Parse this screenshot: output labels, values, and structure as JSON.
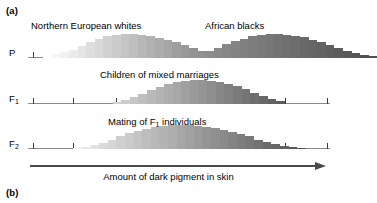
{
  "figure": {
    "panel_a_label": "(a)",
    "panel_b_label": "(b)",
    "axis_caption": "Amount of dark pigment in skin",
    "arrow_icon": "right-arrow-icon"
  },
  "rows": [
    {
      "id": "P",
      "gen_label": "P",
      "gen_label_sub": ""
    },
    {
      "id": "F1",
      "gen_label": "F",
      "gen_label_sub": "1"
    },
    {
      "id": "F2",
      "gen_label": "F",
      "gen_label_sub": "2"
    }
  ],
  "titles": {
    "northern_european_whites": "Northern European whites",
    "african_blacks": "African blacks",
    "children_of_mixed_marriages": "Children of mixed marriages",
    "mating_of_f1_individuals_pre": "Mating of F",
    "mating_of_f1_individuals_sub": "1",
    "mating_of_f1_individuals_post": " individuals"
  },
  "colors": {
    "axis_line": "#8a8a8a",
    "tick": "#3d3d3d",
    "arrow": "#4a4a4a",
    "text": "#000000",
    "lightest_pigment": "#fbfbfb",
    "darkest_pigment": "#4d4d4d"
  },
  "chart_data": {
    "type": "bar",
    "xlabel": "Amount of dark pigment in skin",
    "ylabel": "",
    "grid": false,
    "legend": "none",
    "axis": {
      "x_start_px": 28,
      "x_end_px": 330,
      "n_ticks": 8,
      "tick_positions_pct": [
        1.5,
        15.0,
        29.0,
        43.0,
        57.0,
        71.0,
        85.0,
        99.0
      ]
    },
    "series": [
      {
        "name": "Northern European whites",
        "row": "P",
        "bin_start_pct": 5.0,
        "bin_width_pct": 2.85,
        "values": [
          2,
          3,
          5,
          7,
          10,
          13,
          16,
          18,
          19,
          20,
          20,
          19,
          18,
          17,
          15,
          13,
          11,
          8,
          6,
          4,
          3,
          2
        ],
        "shade_start": "#fdfdfd",
        "shade_end": "#7a7a7a"
      },
      {
        "name": "African blacks",
        "row": "P",
        "bin_start_pct": 53.0,
        "bin_width_pct": 2.85,
        "values": [
          2,
          4,
          6,
          9,
          12,
          15,
          17,
          19,
          20,
          21,
          21,
          20,
          19,
          18,
          16,
          14,
          11,
          9,
          6,
          4,
          3,
          2
        ],
        "shade_start": "#949494",
        "shade_end": "#4f4f4f"
      },
      {
        "name": "Children of mixed marriages",
        "row": "F1",
        "bin_start_pct": 28.0,
        "bin_width_pct": 2.85,
        "values": [
          2,
          4,
          7,
          10,
          13,
          16,
          19,
          21,
          22,
          23,
          23,
          22,
          21,
          19,
          17,
          14,
          11,
          8,
          5,
          3
        ],
        "shade_start": "#d2d2d2",
        "shade_end": "#5c5c5c"
      },
      {
        "name": "Mating of F1 individuals",
        "row": "F2",
        "bin_start_pct": 15.0,
        "bin_width_pct": 2.85,
        "values": [
          1,
          2,
          4,
          6,
          9,
          12,
          15,
          17,
          19,
          21,
          22,
          23,
          23,
          23,
          22,
          21,
          20,
          18,
          16,
          14,
          12,
          9,
          7,
          5,
          3,
          2,
          1
        ],
        "shade_start": "#ededed",
        "shade_end": "#555555"
      }
    ]
  }
}
